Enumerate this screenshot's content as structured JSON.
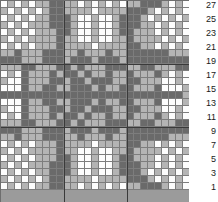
{
  "chart_data": {
    "type": "heatmap",
    "title": "",
    "xlabel": "",
    "ylabel": "",
    "columns": 27,
    "rows": 27,
    "legend": [
      {
        "key": "w",
        "label": "white",
        "color": "#fdfdfd"
      },
      {
        "key": "l",
        "label": "light-gray",
        "color": "#b4b4b4"
      },
      {
        "key": "d",
        "label": "dark-gray",
        "color": "#6a6a6a"
      }
    ],
    "row_labels": [
      "27",
      "25",
      "23",
      "21",
      "19",
      "17",
      "15",
      "13",
      "11",
      "9",
      "7",
      "5",
      "3",
      "1"
    ],
    "row_label_rows": [
      27,
      25,
      23,
      21,
      19,
      17,
      15,
      13,
      11,
      9,
      7,
      5,
      3,
      1
    ],
    "grid": [
      "wlwlwllddllwlwlwlwlldddlwlw",
      "lwlwlwlddllllwlllldddlwlwlw",
      "wlwlwlldddlwwlwwldddlwlwlwl",
      "lwlwllldddlwwlwwldddllwlwlw",
      "wlwlwlllddlwwlwwlddlllwlwlw",
      "lwlwlllldllwwlwwlldllllwlwl",
      "wlwlwllldllllwllllddllwlwlw",
      "lldllldddlldllldllddddddlll",
      "dddllldddldddldddlddddddddd",
      "lllddlllddldllldddllddllldd",
      "wlwdllldlddldlldlldllldlwlw",
      "lwwdlllddlddldddllddlllwwlw",
      "wwwdllddlldddldllddllldwwwl",
      "dddddddddddddddddddddddddd",
      "wwwdllddlldddldllddllldwwwl",
      "lwwdlllddlddldddllddlllwwlw",
      "wlwdllldlddldlldlldllldlwlw",
      "lllddlllddldllldddllddllldd",
      "dddllldddldddldddlddddddddd",
      "lldllldddlldllldllddddddlll",
      "wlwlwllldllllwllllddllwlwlw",
      "lwlwlllldllwwlwwlldllllwlwl",
      "wlwlwlllddlwwlwwlddlllwlwlw",
      "lwlwllldddlwwlwwldddllwlwlw",
      "wlwlwlldddlwwlwwldddlwlwlwl",
      "lwlwlwlddllllwlllldddlwlwlw",
      "wlwlwllddllwlwlwlwlldddlwlw"
    ]
  }
}
